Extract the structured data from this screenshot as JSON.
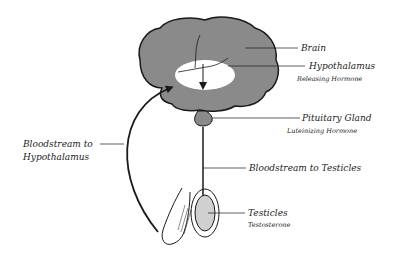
{
  "diagram": {
    "title": "",
    "labels": {
      "brain": "Brain",
      "hypothalamus": "Hypothalamus",
      "hypothalamus_hormone": "Releasing Hormone",
      "pituitary": "Pituitary Gland",
      "pituitary_hormone": "Luteinizing Hormone",
      "bloodstream_testicles": "Bloodstream to Testicles",
      "bloodstream_hypothalamus_line1": "Bloodstream to",
      "bloodstream_hypothalamus_line2": "Hypothalamus",
      "testicles": "Testicles",
      "testicles_hormone": "Testosterone"
    },
    "colors": {
      "brain_fill": "#8a8a8a",
      "outline": "#1a1a1a",
      "hypothalamus_fill": "#ffffff",
      "background": "#ffffff"
    }
  }
}
